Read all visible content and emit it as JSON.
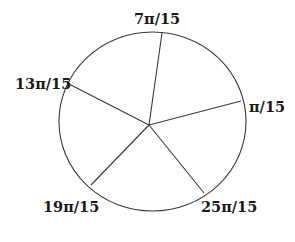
{
  "diagram": {
    "type": "circle-divided-by-radii",
    "center": {
      "x": 149,
      "y": 125
    },
    "circle": {
      "cx": 152.5,
      "cy": 121.5,
      "rx": 93.5,
      "ry": 89.5
    },
    "stroke_color": "#3a3a3a",
    "spokes": [
      {
        "label": "π/15",
        "end": {
          "x": 241,
          "y": 101
        },
        "label_pos": {
          "x": 249,
          "y": 112
        }
      },
      {
        "label": "7π/15",
        "end": {
          "x": 162,
          "y": 33
        },
        "label_pos": {
          "x": 134,
          "y": 24
        }
      },
      {
        "label": "13π/15",
        "end": {
          "x": 67,
          "y": 83
        },
        "label_pos": {
          "x": 15,
          "y": 89
        }
      },
      {
        "label": "19π/15",
        "end": {
          "x": 91,
          "y": 185
        },
        "label_pos": {
          "x": 43,
          "y": 212
        }
      },
      {
        "label": "25π/15",
        "end": {
          "x": 204,
          "y": 193
        },
        "label_pos": {
          "x": 201,
          "y": 212
        }
      }
    ]
  }
}
